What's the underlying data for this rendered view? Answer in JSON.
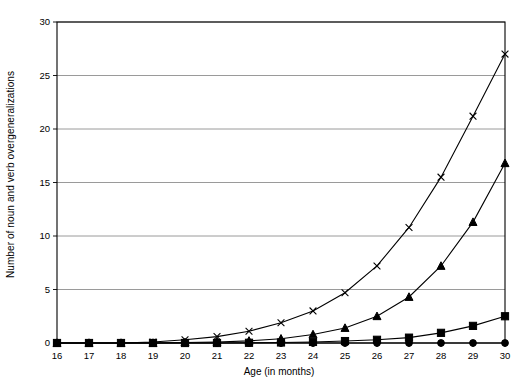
{
  "chart_data": {
    "type": "line",
    "title": "",
    "xlabel": "Age (in months)",
    "ylabel": "Number of noun and verb overgeneralizations",
    "x": [
      16,
      17,
      18,
      19,
      20,
      21,
      22,
      23,
      24,
      25,
      26,
      27,
      28,
      29,
      30
    ],
    "xtick_labels": [
      "16",
      "17",
      "18",
      "19",
      "20",
      "21",
      "22",
      "23",
      "24",
      "25",
      "26",
      "27",
      "28",
      "29",
      "30"
    ],
    "ytick_labels": [
      "0",
      "5",
      "10",
      "15",
      "20",
      "25",
      "30"
    ],
    "yticks": [
      0,
      5,
      10,
      15,
      20,
      25,
      30
    ],
    "xlim": [
      16,
      30
    ],
    "ylim": [
      0,
      30
    ],
    "grid": "horizontal",
    "legend": "none",
    "series": [
      {
        "name": "series-cross",
        "marker": "x",
        "color": "#000000",
        "values": [
          0,
          0,
          0,
          0.1,
          0.3,
          0.6,
          1.1,
          1.9,
          3.0,
          4.7,
          7.2,
          10.8,
          15.5,
          21.2,
          27.0
        ]
      },
      {
        "name": "series-triangle",
        "marker": "triangle",
        "color": "#000000",
        "values": [
          0,
          0,
          0,
          0,
          0.05,
          0.1,
          0.2,
          0.4,
          0.8,
          1.4,
          2.5,
          4.3,
          7.2,
          11.3,
          16.8
        ]
      },
      {
        "name": "series-square",
        "marker": "square",
        "color": "#000000",
        "values": [
          0,
          0,
          0,
          0,
          0,
          0,
          0.02,
          0.05,
          0.1,
          0.18,
          0.3,
          0.5,
          0.95,
          1.6,
          2.5
        ]
      },
      {
        "name": "series-circle",
        "marker": "circle",
        "color": "#000000",
        "values": [
          0,
          0,
          0,
          0,
          0,
          0,
          0,
          0,
          0,
          0,
          0,
          0,
          0,
          0,
          0
        ]
      }
    ]
  }
}
